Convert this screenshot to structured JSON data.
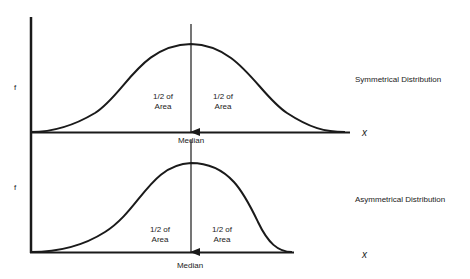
{
  "diagram": {
    "type": "distribution-comparison",
    "panels": [
      {
        "title": "Symmetrical Distribution",
        "y_label": "f",
        "x_label": "x",
        "left_area_label": [
          "1/2 of",
          "Area"
        ],
        "right_area_label": [
          "1/2 of",
          "Area"
        ],
        "median_label": "Median"
      },
      {
        "title": "Asymmetrical Distribution",
        "y_label": "f",
        "x_label": "x",
        "left_area_label": [
          "1/2 of",
          "Area"
        ],
        "right_area_label": [
          "1/2 of",
          "Area"
        ],
        "median_label": "Median"
      }
    ]
  },
  "colors": {
    "line": "#1a1a1a",
    "background": "#ffffff"
  }
}
